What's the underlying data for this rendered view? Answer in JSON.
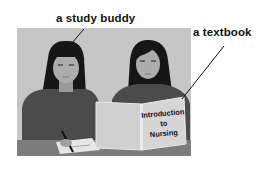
{
  "labels": {
    "study_buddy": "a study buddy",
    "textbook": "a textbook"
  },
  "book_cover": {
    "line1": "Introduction",
    "line2": "to",
    "line3": "Nursing"
  },
  "colors": {
    "background_panel": "#c8c8c8",
    "sweater": "#4a4a4a",
    "hair": "#151515",
    "skin": "#a8a8a8",
    "book": "#d4d4d4",
    "table": "#7a7a7a"
  }
}
